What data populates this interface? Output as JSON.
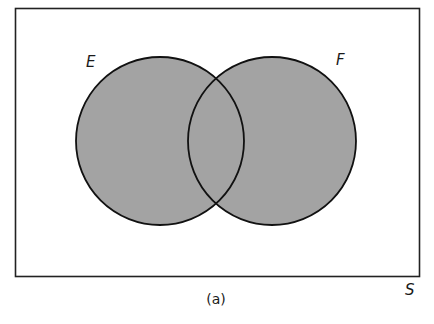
{
  "figure": {
    "caption": "(a)",
    "universe_label": "S",
    "sets": [
      {
        "label": "E",
        "cx": 160,
        "cy": 141,
        "r": 84
      },
      {
        "label": "F",
        "cx": 272,
        "cy": 141,
        "r": 84
      }
    ],
    "shaded_region": "E ∪ F",
    "colors": {
      "fill": "#a3a3a3",
      "stroke": "#111111",
      "background": "#ffffff"
    }
  }
}
